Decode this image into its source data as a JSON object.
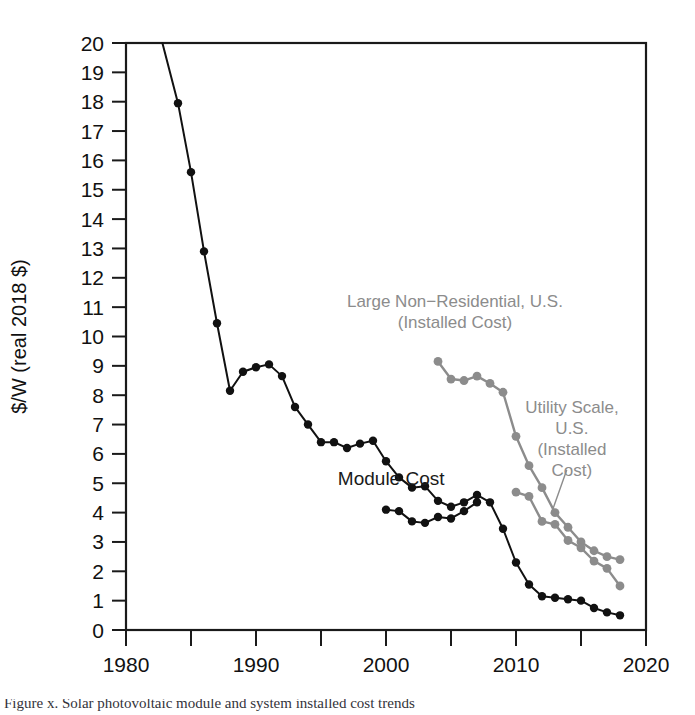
{
  "figure": {
    "caption": "Figure x. Solar photovoltaic module and system installed cost trends"
  },
  "chart_data": {
    "type": "line",
    "title": "",
    "xlabel": "",
    "ylabel": "$/W (real 2018 $)",
    "xlim": [
      1980,
      2020
    ],
    "ylim": [
      0,
      20
    ],
    "grid": false,
    "legend_position": "inline-annotations",
    "x_ticks_major": [
      1980,
      1990,
      2000,
      2010,
      2020
    ],
    "x_ticks_minor": [
      1985,
      1995,
      2005,
      2015
    ],
    "y_ticks": [
      0,
      1,
      2,
      3,
      4,
      5,
      6,
      7,
      8,
      9,
      10,
      11,
      12,
      13,
      14,
      15,
      16,
      17,
      18,
      19,
      20
    ],
    "colors": {
      "module_cost": "#111111",
      "installed_gray": "#8c8c8c"
    },
    "series": [
      {
        "name": "Module Cost",
        "color": "#111111",
        "label": "Module Cost",
        "x": [
          1982.8,
          1984,
          1985,
          1986,
          1987,
          1988,
          1989,
          1990,
          1991,
          1992,
          1993,
          1994,
          1995,
          1996,
          1997,
          1998,
          1999,
          2000,
          2001,
          2002,
          2003,
          2004,
          2005,
          2006,
          2007,
          2008,
          2009,
          2010,
          2011,
          2012,
          2013,
          2014,
          2015,
          2016,
          2017,
          2018
        ],
        "y": [
          20.0,
          17.95,
          15.6,
          12.9,
          10.45,
          8.15,
          8.8,
          8.95,
          9.05,
          8.65,
          7.6,
          7.0,
          6.4,
          6.4,
          6.2,
          6.35,
          6.45,
          5.75,
          5.2,
          4.85,
          4.9,
          4.4,
          4.2,
          4.35,
          4.6,
          4.35,
          3.45,
          2.3,
          1.55,
          1.15,
          1.1,
          1.05,
          1.0,
          0.75,
          0.6,
          0.5
        ],
        "note": "black upper module price curve 1982-2018"
      },
      {
        "name": "Module Cost (second black series)",
        "color": "#111111",
        "label": "",
        "x": [
          2000,
          2001,
          2002,
          2003,
          2004,
          2005,
          2006,
          2007
        ],
        "y": [
          4.1,
          4.05,
          3.7,
          3.65,
          3.85,
          3.8,
          4.05,
          4.35
        ],
        "note": "lower black branch merging near 2007"
      },
      {
        "name": "Large Non-Residential, U.S. (Installed Cost)",
        "color": "#8c8c8c",
        "label": "Large Non−Residential, U.S.\n(Installed Cost)",
        "x": [
          2004,
          2005,
          2006,
          2007,
          2008,
          2009,
          2010,
          2011,
          2012,
          2013,
          2014,
          2015,
          2016,
          2017,
          2018
        ],
        "y": [
          9.15,
          8.55,
          8.5,
          8.65,
          8.4,
          8.1,
          6.6,
          5.6,
          4.85,
          4.0,
          3.5,
          3.0,
          2.7,
          2.5,
          2.4
        ],
        "note": "upper gray installed-cost curve starting 2004"
      },
      {
        "name": "Utility Scale, U.S. (Installed Cost)",
        "color": "#8c8c8c",
        "label": "Utility Scale,\nU.S.\n(Installed\nCost)",
        "x": [
          2010,
          2011,
          2012,
          2013,
          2014,
          2015,
          2016,
          2017,
          2018
        ],
        "y": [
          4.7,
          4.55,
          3.7,
          3.6,
          3.05,
          2.8,
          2.35,
          2.1,
          1.5
        ],
        "note": "lower gray utility-scale curve starting 2010"
      }
    ],
    "annotations": [
      {
        "id": "module-cost-label",
        "text": "Module Cost",
        "lines": [
          "Module Cost"
        ],
        "color": "#1a1a1a",
        "x": 2000.4,
        "y": 4.95
      },
      {
        "id": "large-non-residential-label",
        "text": "Large Non−Residential, U.S. (Installed Cost)",
        "lines": [
          "Large Non−Residential, U.S.",
          "(Installed Cost)"
        ],
        "color": "#8c8c8c",
        "x": 2005.3,
        "y": 11.0
      },
      {
        "id": "utility-scale-label",
        "text": "Utility Scale, U.S. (Installed Cost)",
        "lines": [
          "Utility Scale,",
          "U.S.",
          "(Installed",
          "Cost)"
        ],
        "color": "#8c8c8c",
        "x": 2014.3,
        "y": 7.4
      }
    ]
  }
}
